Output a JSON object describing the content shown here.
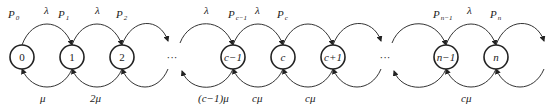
{
  "diagram": {
    "type": "birth-death-chain",
    "states": [
      {
        "id": "s0",
        "label": "0",
        "cx": 22
      },
      {
        "id": "s1",
        "label": "1",
        "cx": 72
      },
      {
        "id": "s2",
        "label": "2",
        "cx": 122
      },
      {
        "id": "sc-1",
        "label": "c−1",
        "cx": 233
      },
      {
        "id": "sc",
        "label": "c",
        "cx": 283
      },
      {
        "id": "sc+1",
        "label": "c+1",
        "cx": 333
      },
      {
        "id": "sn-1",
        "label": "n−1",
        "cx": 446
      },
      {
        "id": "sn",
        "label": "n",
        "cx": 496
      }
    ],
    "ellipses": [
      {
        "label": "···",
        "x": 172
      },
      {
        "label": "···",
        "x": 385
      }
    ],
    "prob_labels": [
      {
        "main": "P",
        "sub": "0",
        "x": 8
      },
      {
        "main": "P",
        "sub": "1",
        "x": 58
      },
      {
        "main": "P",
        "sub": "2",
        "x": 116
      },
      {
        "main": "P",
        "sub": "c−1",
        "x": 228
      },
      {
        "main": "P",
        "sub": "c",
        "x": 277
      },
      {
        "main": "P",
        "sub": "n−1",
        "x": 433
      },
      {
        "main": "P",
        "sub": "n",
        "x": 490
      }
    ],
    "arrival_labels": [
      {
        "text": "λ",
        "x": 44
      },
      {
        "text": "λ",
        "x": 95
      },
      {
        "text": "λ",
        "x": 204
      },
      {
        "text": "λ",
        "x": 255
      },
      {
        "text": "λ",
        "x": 467
      }
    ],
    "service_labels": [
      {
        "text": "μ",
        "x": 40
      },
      {
        "text": "2μ",
        "x": 90
      },
      {
        "text": "(c−1)μ",
        "x": 198
      },
      {
        "text": "cμ",
        "x": 252
      },
      {
        "text": "cμ",
        "x": 305
      },
      {
        "text": "cμ",
        "x": 461
      }
    ]
  }
}
